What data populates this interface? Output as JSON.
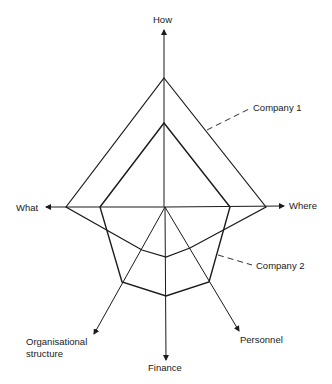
{
  "diagram": {
    "type": "radar-comparison",
    "axes": {
      "how": "How",
      "what": "What",
      "where": "Where",
      "organisational_structure_line1": "Organisational",
      "organisational_structure_line2": "structure",
      "finance": "Finance",
      "personnel": "Personnel"
    },
    "series": [
      {
        "name": "Company 1",
        "label": "Company 1"
      },
      {
        "name": "Company 2",
        "label": "Company 2"
      }
    ],
    "colors": {
      "line": "#1a1a1a",
      "background": "#ffffff"
    }
  }
}
